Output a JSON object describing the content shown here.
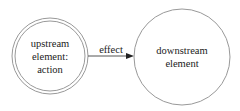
{
  "diagram": {
    "nodes": [
      {
        "id": "upstream",
        "lines": [
          "upstream",
          "element:",
          "action"
        ],
        "shape": "doublecircle"
      },
      {
        "id": "downstream",
        "lines": [
          "downstream",
          "element"
        ],
        "shape": "circle"
      }
    ],
    "edges": [
      {
        "from": "upstream",
        "to": "downstream",
        "label": "effect"
      }
    ],
    "colors": {
      "stroke": "#888888",
      "text": "#222222",
      "background": "#ffffff"
    }
  }
}
